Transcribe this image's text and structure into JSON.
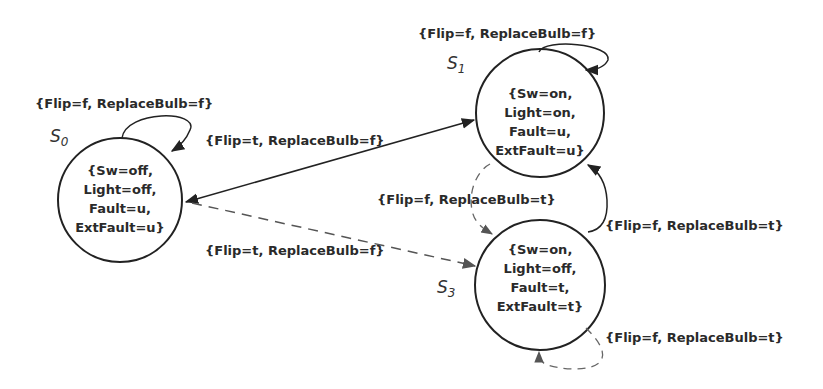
{
  "diagram": {
    "type": "state-machine",
    "states": [
      {
        "id": "S0",
        "name": "S",
        "sub": "0",
        "lines": [
          "{Sw=off,",
          "Light=off,",
          "Fault=u,",
          "ExtFault=u}"
        ]
      },
      {
        "id": "S1",
        "name": "S",
        "sub": "1",
        "lines": [
          "{Sw=on,",
          "Light=on,",
          "Fault=u,",
          "ExtFault=u}"
        ]
      },
      {
        "id": "S3",
        "name": "S",
        "sub": "3",
        "lines": [
          "{Sw=on,",
          "Light=off,",
          "Fault=t,",
          "ExtFault=t}"
        ]
      }
    ],
    "transitions": [
      {
        "from": "S0",
        "to": "S0",
        "style": "solid",
        "label": "{Flip=f, ReplaceBulb=f}"
      },
      {
        "from": "S1",
        "to": "S1",
        "style": "solid",
        "label": "{Flip=f, ReplaceBulb=f}"
      },
      {
        "from": "S0",
        "to": "S1",
        "style": "solid",
        "bidirectional": true,
        "label": "{Flip=t, ReplaceBulb=f}"
      },
      {
        "from": "S0",
        "to": "S3",
        "style": "dashed",
        "label": "{Flip=t, ReplaceBulb=f}"
      },
      {
        "from": "S1",
        "to": "S3",
        "style": "dashed",
        "label": "{Flip=f, ReplaceBulb=t}"
      },
      {
        "from": "S3",
        "to": "S1",
        "style": "solid",
        "label": "{Flip=f, ReplaceBulb=t}"
      },
      {
        "from": "S3",
        "to": "S3",
        "style": "dashed",
        "label": "{Flip=f, ReplaceBulb=t}"
      }
    ]
  }
}
